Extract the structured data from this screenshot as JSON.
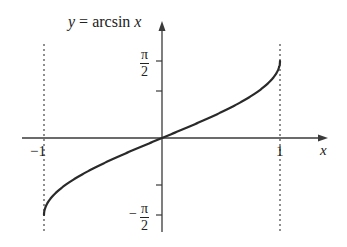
{
  "chart_data": {
    "type": "line",
    "title": "y = arcsin x",
    "function": "arcsin",
    "xlabel": "x",
    "ylabel": "",
    "xlim": [
      -1.15,
      1.4
    ],
    "ylim": [
      -1.9,
      2.4
    ],
    "x_ticks": [
      {
        "value": -1,
        "label": "−1"
      },
      {
        "value": 1,
        "label": "1"
      }
    ],
    "y_ticks": [
      {
        "value": 1.5708,
        "label": "π/2"
      },
      {
        "value": 1,
        "label": ""
      },
      {
        "value": -1,
        "label": ""
      },
      {
        "value": -1.5708,
        "label": "−π/2"
      }
    ],
    "asymptote_guides": [
      {
        "x": -1,
        "style": "dotted"
      },
      {
        "x": 1,
        "style": "dotted"
      }
    ],
    "series": [
      {
        "name": "y = arcsin x",
        "x": [
          -1,
          -0.99,
          -0.95,
          -0.9,
          -0.8,
          -0.6,
          -0.4,
          -0.2,
          0,
          0.2,
          0.4,
          0.6,
          0.8,
          0.9,
          0.95,
          0.99,
          1
        ],
        "y": [
          -1.5708,
          -1.4293,
          -1.2532,
          -1.1198,
          -0.9273,
          -0.6435,
          -0.4115,
          -0.2014,
          0,
          0.2014,
          0.4115,
          0.6435,
          0.9273,
          1.1198,
          1.2532,
          1.4293,
          1.5708
        ]
      }
    ],
    "grid": false,
    "legend": null
  },
  "labels": {
    "title_y": "y",
    "title_eq": " = arcsin ",
    "title_x": "x",
    "x_axis": "x",
    "tick_neg1": "−1",
    "tick_pos1": "1",
    "pi": "π",
    "two": "2",
    "minus": "−"
  },
  "colors": {
    "curve": "#2a2a2a",
    "axes": "#3a3a3a",
    "guides": "#555555",
    "background": "#ffffff"
  }
}
